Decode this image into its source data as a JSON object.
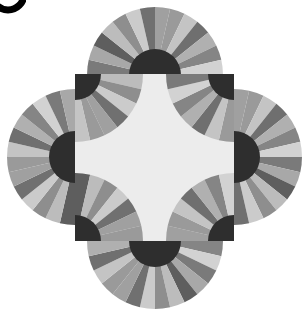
{
  "image": {
    "subject": "quilt block with fan motifs",
    "width": 304,
    "height": 311,
    "background": "#ffffff"
  },
  "square": {
    "x": 75,
    "y": 74,
    "x2": 234,
    "y2": 241,
    "center_color": "#ececec"
  },
  "fans": {
    "outer_radius": 68,
    "inner_radius": 26,
    "hub_color": "#2e2e2e",
    "blade_count": 14,
    "blade_colors": [
      "#9a9a9a",
      "#c4c4c4",
      "#6f6f6f",
      "#b0b0b0",
      "#858585",
      "#d2d2d2",
      "#7a7a7a",
      "#a8a8a8",
      "#5e5e5e",
      "#bcbcbc",
      "#8e8e8e",
      "#cbcbcb",
      "#707070",
      "#a0a0a0"
    ],
    "outer": [
      {
        "name": "top",
        "cx": 155,
        "cy": 75,
        "start": 180,
        "end": 360
      },
      {
        "name": "right",
        "cx": 234,
        "cy": 157,
        "start": 270,
        "end": 450
      },
      {
        "name": "bottom",
        "cx": 155,
        "cy": 241,
        "start": 0,
        "end": 180
      },
      {
        "name": "left",
        "cx": 75,
        "cy": 157,
        "start": 90,
        "end": 270
      }
    ],
    "corners": [
      {
        "name": "top-left",
        "cx": 75,
        "cy": 74,
        "start": 0,
        "end": 90
      },
      {
        "name": "top-right",
        "cx": 234,
        "cy": 74,
        "start": 90,
        "end": 180
      },
      {
        "name": "bottom-right",
        "cx": 234,
        "cy": 241,
        "start": 180,
        "end": 270
      },
      {
        "name": "bottom-left",
        "cx": 75,
        "cy": 241,
        "start": 270,
        "end": 360
      }
    ]
  }
}
